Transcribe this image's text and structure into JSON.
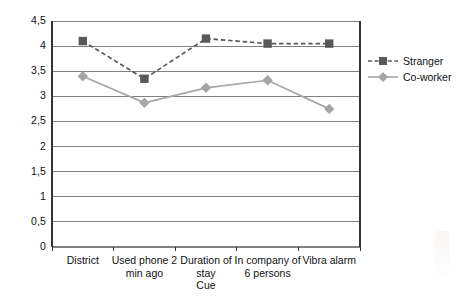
{
  "chart_data": {
    "type": "line",
    "title": "",
    "xlabel": "Cue",
    "ylabel": "",
    "ylim": [
      0,
      4.5
    ],
    "ytick_labels": [
      "4,5",
      "4",
      "3,5",
      "3",
      "2,5",
      "2",
      "1,5",
      "1",
      "0,5",
      "0"
    ],
    "ytick_values": [
      4.5,
      4,
      3.5,
      3,
      2.5,
      2,
      1.5,
      1,
      0.5,
      0
    ],
    "grid": true,
    "legend_position": "right",
    "categories": [
      "District",
      "Used phone 2\nmin ago",
      "Duration of\nstay",
      "In company of\n6 persons",
      "Vibra alarm"
    ],
    "series": [
      {
        "name": "Stranger",
        "values": [
          4.1,
          3.35,
          4.15,
          4.05,
          4.05
        ],
        "color": "#595959",
        "line_style": "dashed",
        "marker": "square"
      },
      {
        "name": "Co-worker",
        "values": [
          3.4,
          2.87,
          3.17,
          3.32,
          2.75
        ],
        "color": "#a6a6a6",
        "line_style": "solid",
        "marker": "diamond"
      }
    ]
  },
  "legend": {
    "items": [
      {
        "label": "Stranger"
      },
      {
        "label": "Co-worker"
      }
    ]
  },
  "axis": {
    "x_caption": "Cue"
  },
  "colors": {
    "stranger": "#595959",
    "coworker": "#a6a6a6",
    "grid": "#808080",
    "axis": "#333333",
    "text": "#111111"
  }
}
